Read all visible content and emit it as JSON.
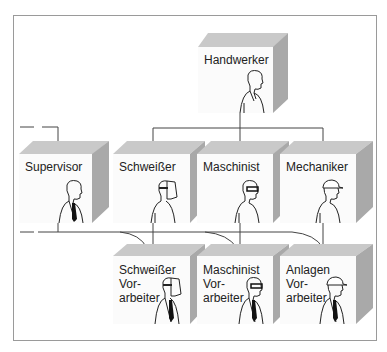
{
  "diagram": {
    "type": "org-chart",
    "root": {
      "id": "handwerker",
      "label": "Handwerker",
      "figure": "plain"
    },
    "level2": [
      {
        "id": "supervisor",
        "label": "Supervisor",
        "figure": "tie"
      },
      {
        "id": "schweisser",
        "label": "Schweißer",
        "figure": "welding-mask"
      },
      {
        "id": "maschinist",
        "label": "Maschinist",
        "figure": "glasses"
      },
      {
        "id": "mechaniker",
        "label": "Mechaniker",
        "figure": "hard-hat"
      }
    ],
    "level3": [
      {
        "id": "schweisser-vorarbeiter",
        "label": "Schweißer\nVor-\narbeiter",
        "figure": "welding-mask-tie"
      },
      {
        "id": "maschinist-vorarbeiter",
        "label": "Maschinist\nVor-\narbeiter",
        "figure": "glasses-tie"
      },
      {
        "id": "anlagen-vorarbeiter",
        "label": "Anlagen\nVor-\narbeiter",
        "figure": "hard-hat-tie"
      }
    ],
    "edges": [
      {
        "from": "handwerker",
        "to": "schweisser"
      },
      {
        "from": "handwerker",
        "to": "maschinist"
      },
      {
        "from": "handwerker",
        "to": "mechaniker"
      },
      {
        "from": "(external, dashed)",
        "to": "supervisor"
      },
      {
        "from": "schweisser",
        "to": "schweisser-vorarbeiter"
      },
      {
        "from": "maschinist",
        "to": "maschinist-vorarbeiter"
      },
      {
        "from": "mechaniker",
        "to": "anlagen-vorarbeiter"
      },
      {
        "from": "supervisor",
        "to": "schweisser-vorarbeiter"
      },
      {
        "from": "supervisor",
        "to": "maschinist-vorarbeiter"
      },
      {
        "from": "supervisor",
        "to": "anlagen-vorarbeiter"
      }
    ]
  },
  "colors": {
    "box_front": "#fbfbfb",
    "box_top": "#c9c9c9",
    "box_side": "#a9a9a9",
    "line": "#444444",
    "frame": "#9a9a9a"
  }
}
